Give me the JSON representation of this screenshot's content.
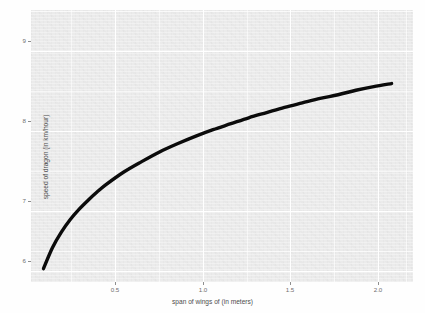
{
  "chart_data": {
    "type": "line",
    "title": "",
    "xlabel": "span of wings of (in meters)",
    "ylabel": "speed of dragon (in km/hour)",
    "xlim": [
      0.08,
      2.22
    ],
    "ylim": [
      5.82,
      9.48
    ],
    "xticks": [
      0.5,
      1.0,
      1.5,
      2.0
    ],
    "xtick_labels": [
      "0.5",
      "1.0",
      "1.5",
      "2.0"
    ],
    "yticks": [
      6,
      7,
      8,
      9
    ],
    "ytick_labels": [
      "6",
      "7",
      "8",
      "9"
    ],
    "grid": true,
    "legend": "none",
    "series": [
      {
        "name": "speed of dragon",
        "x": [
          0.15,
          0.2,
          0.25,
          0.3,
          0.35,
          0.4,
          0.45,
          0.5,
          0.6,
          0.7,
          0.8,
          0.9,
          1.0,
          1.1,
          1.2,
          1.3,
          1.4,
          1.5,
          1.6,
          1.7,
          1.8,
          1.9,
          2.0,
          2.1
        ],
        "y": [
          6.0,
          6.28,
          6.49,
          6.66,
          6.8,
          6.92,
          7.03,
          7.13,
          7.3,
          7.44,
          7.57,
          7.68,
          7.78,
          7.87,
          7.95,
          8.03,
          8.1,
          8.17,
          8.23,
          8.29,
          8.34,
          8.4,
          8.45,
          8.49
        ]
      }
    ]
  },
  "axes": {
    "x_title": "span of wings of (in meters)",
    "y_title": "speed of dragon (in km/hour)",
    "x_tick_labels": [
      "0.5",
      "1.0",
      "1.5",
      "2.0"
    ],
    "y_tick_labels": [
      "9",
      "8",
      "7",
      "6"
    ]
  },
  "colors": {
    "panel_background": "#ebebeb",
    "gridline": "#ffffff",
    "curve": "#0b0b0b",
    "tick_text": "#6e6e6e",
    "axis_title_text": "#4d4d4d",
    "page_background": "#fefefe"
  }
}
